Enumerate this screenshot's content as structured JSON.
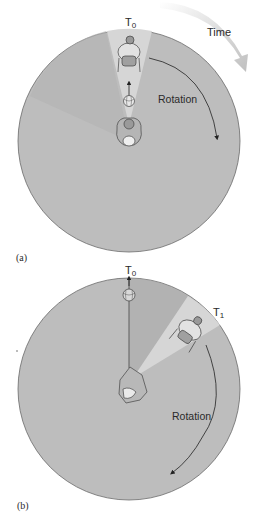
{
  "figure": {
    "panels": [
      {
        "id": "a",
        "panel_label": "(a)",
        "time_label": "Time",
        "t0_label": "T",
        "t0_sub": "0",
        "rotation_label": "Rotation"
      },
      {
        "id": "b",
        "panel_label": "(b)",
        "t0_label": "T",
        "t0_sub": "0",
        "t1_label": "T",
        "t1_sub": "1",
        "rotation_label": "Rotation"
      }
    ],
    "colors": {
      "disk": "#bdbdbd",
      "disk_edge": "#6a6a6a",
      "wedge": "#d6d6d6",
      "wedge_dark": "#a9a9a9",
      "arrow": "#222222",
      "time_arrow": "#cfcfcf"
    }
  }
}
